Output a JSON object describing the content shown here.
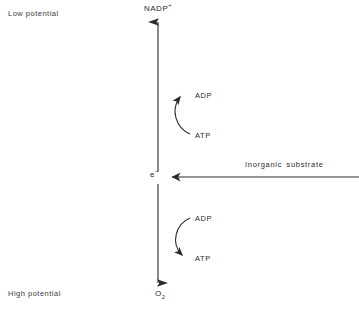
{
  "figure": {
    "type": "biochemical-pathway-diagram",
    "background_color": "#ffffff",
    "line_color": "#2b2b2b",
    "text_color": "#2b2b2b"
  },
  "axis": {
    "orientation": "vertical",
    "top_label": "NADP",
    "top_label_superscript": "+",
    "bottom_label": "O",
    "bottom_label_subscript": "2",
    "midpoint_label": "e",
    "midpoint_label_superscript": "−",
    "low_potential_label": "Low potential",
    "high_potential_label": "High potential"
  },
  "horizontal_arrow": {
    "label": "Inorganic substrate",
    "direction": "leftward-toward-electron-pool"
  },
  "loops": [
    {
      "id": "upper",
      "position": "above-electron-pool",
      "from_label": "ATP",
      "to_label": "ADP",
      "direction": "ATP-to-ADP",
      "meaning": "energy-consuming reverse electron flow"
    },
    {
      "id": "lower",
      "position": "below-electron-pool",
      "from_label": "ADP",
      "to_label": "ATP",
      "direction": "ADP-to-ATP",
      "meaning": "energy-yielding forward electron flow"
    }
  ]
}
